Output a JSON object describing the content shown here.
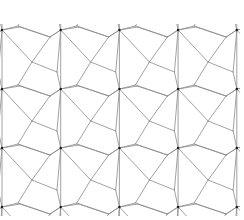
{
  "diagram": {
    "title": "",
    "canvas": {
      "width": 244,
      "height": 220,
      "background": "#ffffff"
    },
    "colors": {
      "edge": "#8a8a8a",
      "node": "#1a1a1a"
    },
    "tile": {
      "period_x": 58.7,
      "period_y": 59,
      "origin_x": 2,
      "origin_y": 30,
      "repeat_x": 4,
      "repeat_y": 3,
      "vertices": {
        "A": [
          0,
          0
        ],
        "B": [
          18,
          -3
        ],
        "C": [
          48,
          7
        ],
        "D": [
          58.7,
          0
        ],
        "E": [
          30,
          32
        ],
        "F": [
          55,
          42
        ],
        "G": [
          16,
          55
        ],
        "H": [
          0,
          59
        ],
        "I": [
          58.7,
          59
        ],
        "J": [
          48,
          66
        ]
      },
      "edges": [
        [
          "A",
          "B"
        ],
        [
          "B",
          "C"
        ],
        [
          "C",
          "D"
        ],
        [
          "A",
          "E"
        ],
        [
          "C",
          "E"
        ],
        [
          "E",
          "F"
        ],
        [
          "D",
          "F"
        ],
        [
          "E",
          "G"
        ],
        [
          "G",
          "H"
        ],
        [
          "F",
          "I"
        ],
        [
          "G",
          "J"
        ],
        [
          "J",
          "I"
        ],
        [
          "A",
          "H"
        ]
      ],
      "dark_nodes": [
        "A",
        "D",
        "H",
        "I"
      ]
    }
  }
}
